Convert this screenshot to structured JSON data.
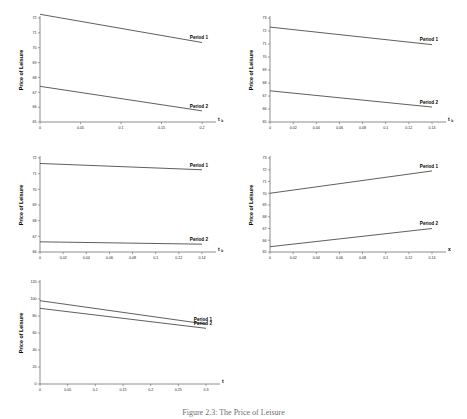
{
  "figure": {
    "caption": "Figure 2.3: The Price of Leisure",
    "ylabel": "Price of Leisure",
    "series_names": [
      "Period 1",
      "Period 2"
    ]
  },
  "chart_data": [
    {
      "id": "panel-1",
      "type": "line",
      "title": "",
      "xlabel": "t",
      "xlabel_sub": "b",
      "ylabel": "Price of Leisure",
      "xlim": [
        0,
        0.2
      ],
      "ylim": [
        65,
        72
      ],
      "xticks": [
        0,
        0.05,
        0.1,
        0.15,
        0.2
      ],
      "xticklabels": [
        "0",
        "0.05",
        "0.1",
        "0.15",
        "0.2"
      ],
      "yticks": [
        65,
        66,
        67,
        68,
        69,
        70,
        71,
        72
      ],
      "yticklabels": [
        "65",
        "66",
        "67",
        "68",
        "69",
        "70",
        "71",
        "72"
      ],
      "grid": false,
      "legend": "inline-right",
      "series": [
        {
          "name": "Period 1",
          "x": [
            0,
            0.2
          ],
          "values": [
            72.25,
            70.35
          ]
        },
        {
          "name": "Period 2",
          "x": [
            0,
            0.2
          ],
          "values": [
            67.4,
            65.75
          ]
        }
      ]
    },
    {
      "id": "panel-2",
      "type": "line",
      "title": "",
      "xlabel": "t",
      "xlabel_sub": "b",
      "ylabel": "Price of Leisure",
      "xlim": [
        0,
        0.14
      ],
      "ylim": [
        65,
        73
      ],
      "xticks": [
        0,
        0.02,
        0.04,
        0.06,
        0.08,
        0.1,
        0.12,
        0.14
      ],
      "xticklabels": [
        "0",
        "0.02",
        "0.04",
        "0.06",
        "0.08",
        "0.1",
        "0.12",
        "0.14"
      ],
      "yticks": [
        65,
        66,
        67,
        68,
        69,
        70,
        71,
        72,
        73
      ],
      "yticklabels": [
        "65",
        "66",
        "67",
        "68",
        "69",
        "70",
        "71",
        "72",
        "73"
      ],
      "grid": false,
      "legend": "inline-right",
      "series": [
        {
          "name": "Period 1",
          "x": [
            0,
            0.14
          ],
          "values": [
            72.3,
            70.95
          ]
        },
        {
          "name": "Period 2",
          "x": [
            0,
            0.14
          ],
          "values": [
            67.4,
            66.15
          ]
        }
      ]
    },
    {
      "id": "panel-3",
      "type": "line",
      "title": "",
      "xlabel": "t",
      "xlabel_sub": "b",
      "ylabel": "Price of Leisure",
      "xlim": [
        0,
        0.14
      ],
      "ylim": [
        66,
        72
      ],
      "xticks": [
        0,
        0.02,
        0.04,
        0.06,
        0.08,
        0.1,
        0.12,
        0.14
      ],
      "xticklabels": [
        "0",
        "0.02",
        "0.04",
        "0.06",
        "0.08",
        "0.1",
        "0.12",
        "0.14"
      ],
      "yticks": [
        66,
        67,
        68,
        69,
        70,
        71,
        72
      ],
      "yticklabels": [
        "66",
        "67",
        "68",
        "69",
        "70",
        "71",
        "72"
      ],
      "grid": false,
      "legend": "inline-right",
      "series": [
        {
          "name": "Period 1",
          "x": [
            0,
            0.14
          ],
          "values": [
            71.65,
            71.25
          ]
        },
        {
          "name": "Period 2",
          "x": [
            0,
            0.14
          ],
          "values": [
            66.65,
            66.5
          ]
        }
      ]
    },
    {
      "id": "panel-4",
      "type": "line",
      "title": "",
      "xlabel": "x",
      "xlabel_sub": "",
      "ylabel": "Price of Leisure",
      "xlim": [
        0,
        0.14
      ],
      "ylim": [
        65,
        73
      ],
      "xticks": [
        0,
        0.02,
        0.04,
        0.06,
        0.08,
        0.1,
        0.12,
        0.14
      ],
      "xticklabels": [
        "0",
        "0.02",
        "0.04",
        "0.06",
        "0.08",
        "0.1",
        "0.12",
        "0.14"
      ],
      "yticks": [
        65,
        66,
        67,
        68,
        69,
        70,
        71,
        72,
        73
      ],
      "yticklabels": [
        "65",
        "66",
        "67",
        "68",
        "69",
        "70",
        "71",
        "72",
        "73"
      ],
      "grid": false,
      "legend": "inline-right",
      "series": [
        {
          "name": "Period 1",
          "x": [
            0,
            0.14
          ],
          "values": [
            70.0,
            71.9
          ]
        },
        {
          "name": "Period 2",
          "x": [
            0,
            0.14
          ],
          "values": [
            65.45,
            67.0
          ]
        }
      ]
    },
    {
      "id": "panel-5",
      "type": "line",
      "title": "",
      "xlabel": "t",
      "xlabel_sub": "",
      "ylabel": "Price of Leisure",
      "xlim": [
        0,
        0.3
      ],
      "ylim": [
        0,
        120
      ],
      "xticks": [
        0,
        0.05,
        0.1,
        0.15,
        0.2,
        0.25,
        0.3
      ],
      "xticklabels": [
        "0",
        "0.05",
        "0.1",
        "0.15",
        "0.2",
        "0.25",
        "0.3"
      ],
      "yticks": [
        0,
        20,
        40,
        60,
        80,
        100,
        120
      ],
      "yticklabels": [
        "0",
        "20",
        "40",
        "60",
        "80",
        "100",
        "120"
      ],
      "grid": false,
      "legend": "inline-right",
      "series": [
        {
          "name": "Period 1",
          "x": [
            0,
            0.3
          ],
          "values": [
            98.0,
            70.5
          ]
        },
        {
          "name": "Period 2",
          "x": [
            0,
            0.3
          ],
          "values": [
            89.0,
            65.5
          ]
        }
      ]
    }
  ]
}
